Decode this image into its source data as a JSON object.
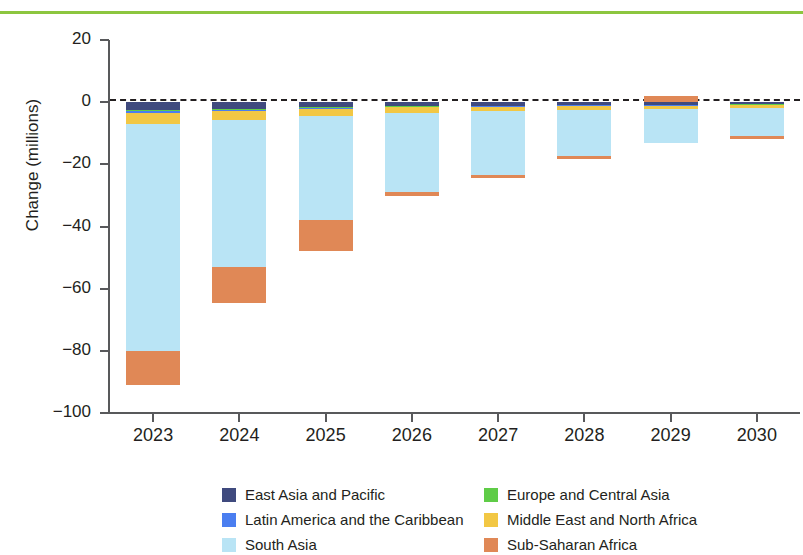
{
  "chart_data": {
    "type": "bar",
    "stacked": true,
    "title": "",
    "subtitle": "",
    "xlabel": "",
    "ylabel": "Change (millions)",
    "categories": [
      "2023",
      "2024",
      "2025",
      "2026",
      "2027",
      "2028",
      "2029",
      "2030"
    ],
    "ylim": [
      -100,
      20
    ],
    "yticks": [
      20,
      0,
      -20,
      -40,
      -60,
      -80,
      -100
    ],
    "ytick_labels": [
      "20",
      "0",
      "−20",
      "−40",
      "−60",
      "−80",
      "−100"
    ],
    "grid": false,
    "zero_line": true,
    "legend_position": "bottom",
    "series": [
      {
        "name": "East Asia and Pacific",
        "color": "#3f4a7e",
        "values": [
          -2.6,
          -2.2,
          -1.6,
          -1.3,
          -1.1,
          -0.9,
          -0.8,
          -0.7
        ]
      },
      {
        "name": "Europe and Central Asia",
        "color": "#5fcc47",
        "values": [
          -0.3,
          -0.2,
          -0.2,
          -0.1,
          -0.1,
          -0.1,
          -0.1,
          -0.1
        ]
      },
      {
        "name": "Latin America and the Caribbean",
        "color": "#4a7ef0",
        "values": [
          -0.6,
          -0.5,
          -0.4,
          -0.3,
          -0.3,
          -0.2,
          -0.2,
          -0.2
        ]
      },
      {
        "name": "Middle East and North Africa",
        "color": "#f2c744",
        "values": [
          -3.6,
          -2.8,
          -2.2,
          -1.8,
          -1.5,
          -1.3,
          -1.1,
          -1.0
        ]
      },
      {
        "name": "South Asia",
        "color": "#b9e4f5",
        "values": [
          -72.9,
          -47.3,
          -33.5,
          -25.5,
          -20.5,
          -14.9,
          -10.8,
          -9.0
        ]
      },
      {
        "name": "Sub-Saharan Africa",
        "color": "#e08856",
        "values": [
          -11.0,
          -11.5,
          -10.1,
          -1.1,
          -1.0,
          -0.9,
          2.0,
          -0.9
        ]
      }
    ],
    "bar_totals": [
      -91.0,
      -64.5,
      -48.0,
      -30.1,
      -24.5,
      -18.3,
      -11.0,
      -11.9
    ],
    "colors": {
      "top_rule": "#8cc63f",
      "axis": "#58595b",
      "text": "#231f20",
      "background": "#ffffff"
    }
  },
  "legend": {
    "entries": [
      {
        "label": "East Asia and Pacific",
        "color": "#3f4a7e"
      },
      {
        "label": "Europe and Central Asia",
        "color": "#5fcc47"
      },
      {
        "label": "Latin America and the Caribbean",
        "color": "#4a7ef0"
      },
      {
        "label": "Middle East and North Africa",
        "color": "#f2c744"
      },
      {
        "label": "South Asia",
        "color": "#b9e4f5"
      },
      {
        "label": "Sub-Saharan Africa",
        "color": "#e08856"
      }
    ]
  }
}
